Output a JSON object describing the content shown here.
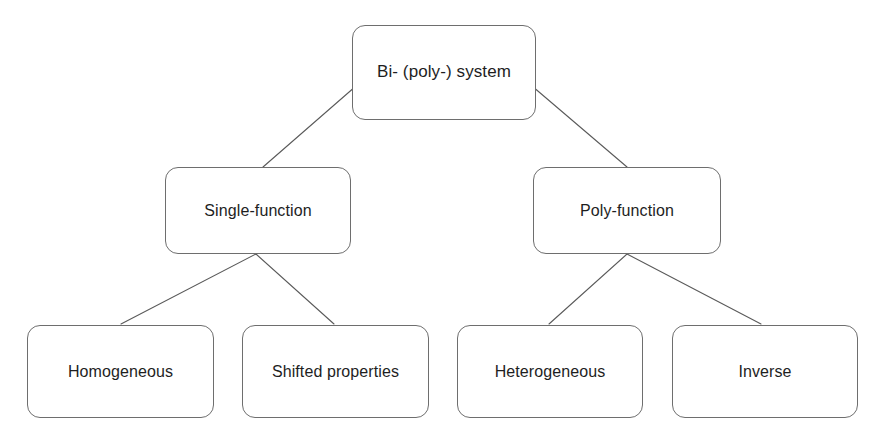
{
  "diagram": {
    "type": "hierarchy-tree",
    "orientation": "top-down",
    "background_color": "#ffffff",
    "node_border_color": "#6e6e6e",
    "node_fill_color": "#ffffff",
    "text_color": "#1e1e1e",
    "connector_color": "#5a5a5a",
    "levels": 3
  },
  "nodes": {
    "root": {
      "label": "Bi- (poly-) system"
    },
    "single_function": {
      "label": "Single-function"
    },
    "poly_function": {
      "label": "Poly-function"
    },
    "homogeneous": {
      "label": "Homogeneous"
    },
    "shifted_properties": {
      "label": "Shifted properties"
    },
    "heterogeneous": {
      "label": "Heterogeneous"
    },
    "inverse": {
      "label": "Inverse"
    }
  },
  "connectors": [
    {
      "name": "root-to-single-function",
      "from": "root",
      "to": "single_function",
      "x1": 356,
      "y1": 86,
      "x2": 263,
      "y2": 167
    },
    {
      "name": "root-to-poly-function",
      "from": "root",
      "to": "poly_function",
      "x1": 532,
      "y1": 86,
      "x2": 627,
      "y2": 167
    },
    {
      "name": "single-function-to-homogeneous",
      "from": "single_function",
      "to": "homogeneous",
      "x1": 256,
      "y1": 254,
      "x2": 121,
      "y2": 324
    },
    {
      "name": "single-function-to-shifted-properties",
      "from": "single_function",
      "to": "shifted_properties",
      "x1": 256,
      "y1": 254,
      "x2": 334,
      "y2": 324
    },
    {
      "name": "poly-function-to-heterogeneous",
      "from": "poly_function",
      "to": "heterogeneous",
      "x1": 627,
      "y1": 254,
      "x2": 549,
      "y2": 324
    },
    {
      "name": "poly-function-to-inverse",
      "from": "poly_function",
      "to": "inverse",
      "x1": 627,
      "y1": 254,
      "x2": 761,
      "y2": 324
    }
  ]
}
